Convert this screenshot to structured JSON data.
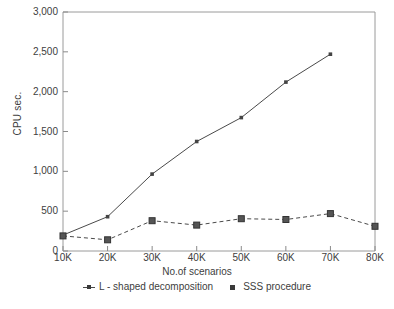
{
  "chart_data": {
    "type": "line",
    "title": "",
    "xlabel": "No.of scenarios",
    "ylabel": "CPU sec.",
    "categories": [
      "10K",
      "20K",
      "30K",
      "40K",
      "50K",
      "60K",
      "70K",
      "80K"
    ],
    "x_values": [
      10000,
      20000,
      30000,
      40000,
      50000,
      60000,
      70000,
      80000
    ],
    "xlim": [
      10000,
      80000
    ],
    "ylim": [
      0,
      3000
    ],
    "ytick_labels": [
      "0",
      "500",
      "1,000",
      "1,500",
      "2,000",
      "2,500",
      "3,000"
    ],
    "ytick_values": [
      0,
      500,
      1000,
      1500,
      2000,
      2500,
      3000
    ],
    "grid": false,
    "legend_position": "bottom",
    "series": [
      {
        "name": "L - shaped decomposition",
        "marker": "dot",
        "line_style": "solid",
        "color": "#4a4a4a",
        "values": [
          200,
          430,
          965,
          1375,
          1675,
          2120,
          2470,
          null
        ]
      },
      {
        "name": "SSS procedure",
        "marker": "square",
        "line_style": "dashed",
        "color": "#4a4a4a",
        "values": [
          190,
          140,
          380,
          325,
          405,
          395,
          470,
          310
        ]
      }
    ]
  },
  "legend": {
    "entries": [
      {
        "label": "L - shaped decomposition",
        "marker": "dot-line-marker"
      },
      {
        "label": "SSS procedure",
        "marker": "square-marker"
      }
    ]
  },
  "axes": {
    "y_title": "CPU sec.",
    "x_title": "No.of scenarios"
  },
  "colors": {
    "axis": "#8a8a8a",
    "series": "#4a4a4a",
    "text": "#404040",
    "background": "#ffffff"
  }
}
